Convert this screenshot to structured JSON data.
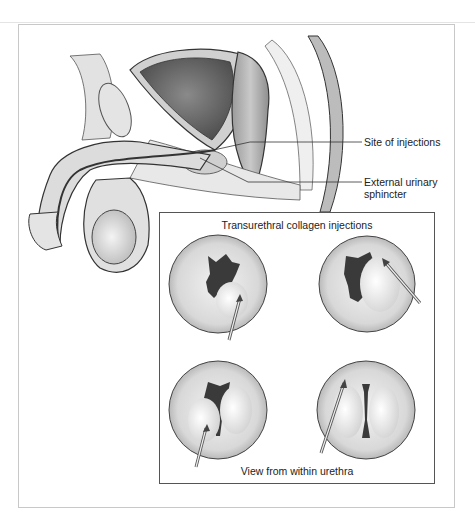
{
  "figure": {
    "labels": {
      "site_of_injections": "Site of injections",
      "external_sphincter_line1": "External urinary",
      "external_sphincter_line2": "sphincter"
    },
    "inset": {
      "title": "Transurethral collagen injections",
      "caption": "View from within urethra",
      "panels": [
        {
          "id": 1,
          "needle_from": "bottom"
        },
        {
          "id": 2,
          "needle_from": "lower-right"
        },
        {
          "id": 3,
          "needle_from": "bottom-left"
        },
        {
          "id": 4,
          "needle_from": "bottom-left"
        }
      ]
    },
    "colors": {
      "line": "#333333",
      "tissue_light": "#e6e6e6",
      "tissue_mid": "#bdbdbd",
      "lumen_dark": "#3a3a3a",
      "frame": "#c8c8c8"
    }
  }
}
